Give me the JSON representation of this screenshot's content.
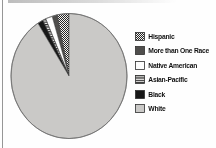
{
  "chart_data": {
    "type": "pie",
    "title": "",
    "categories": [
      "Hispanic",
      "More than One Race",
      "Native American",
      "Asian-Pacific",
      "Black",
      "White"
    ],
    "values": [
      3.3,
      1.4,
      1.9,
      0.9,
      1.5,
      91.0
    ],
    "values_unit": "%",
    "values_estimated": true,
    "swatches": [
      "checker",
      "darkgray",
      "white",
      "hstripes",
      "black",
      "lightgray"
    ],
    "legend_position": "right",
    "slice_order": "counterclockwise from 12 o'clock in legend order",
    "data_labels_shown": false
  },
  "colors": {
    "white_slice_gray": "#cac9c7",
    "dark_gray": "#4f4e4c",
    "black": "#171717",
    "pattern_ink": "#262626",
    "pattern_paper": "#f4f3f1",
    "swatch_border": "#2f2f2f",
    "rim_gray": "#6f6f6f",
    "page_background": "#fefefe",
    "scan_edge_gray": "#8f8f8f"
  }
}
